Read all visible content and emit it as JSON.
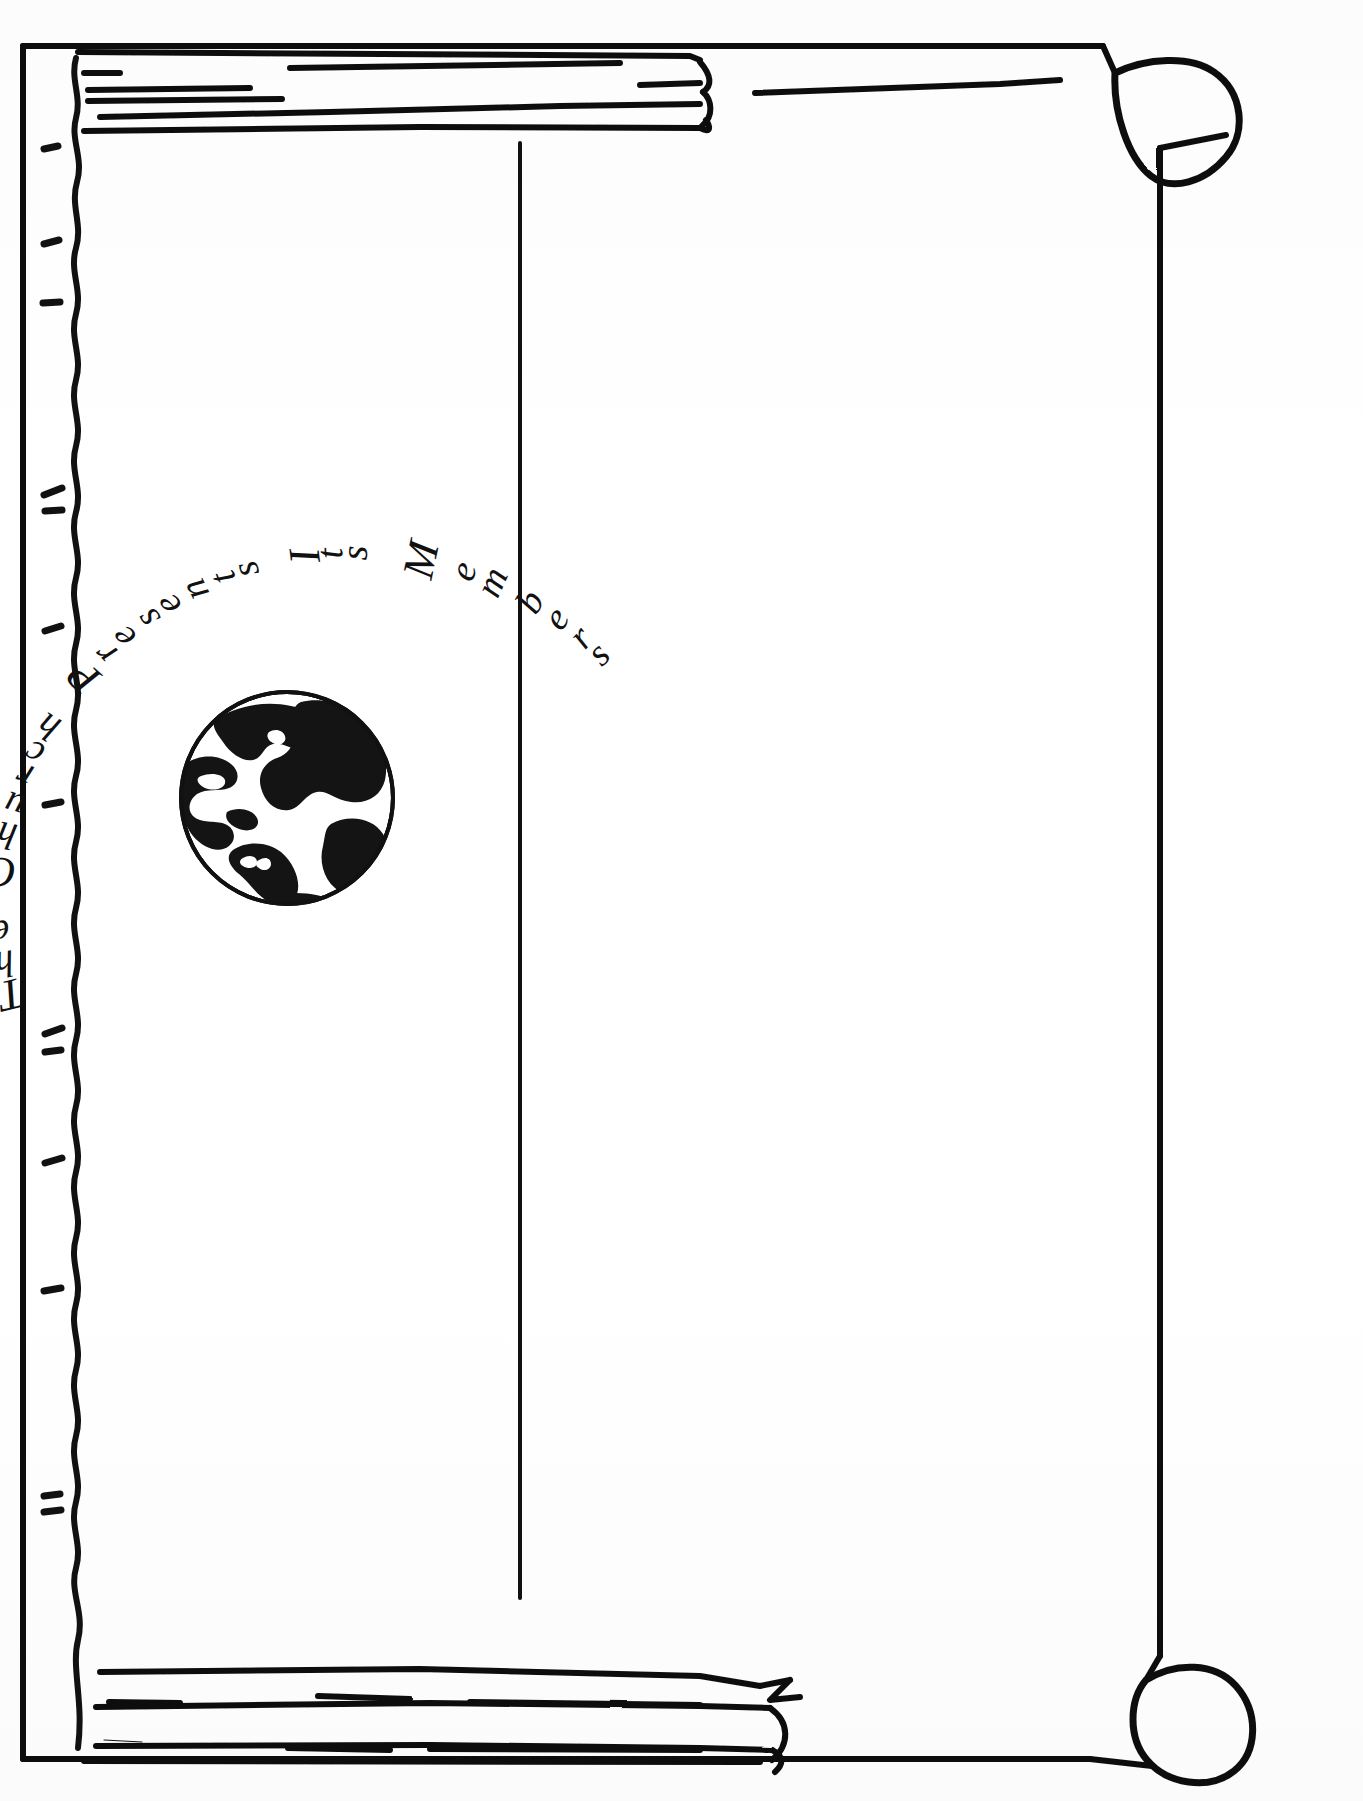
{
  "document": {
    "kind": "scanned-line-art-page",
    "page_background": "#ffffff",
    "ink_color": "#111111",
    "width_px": 1363,
    "height_px": 1801
  },
  "heading": {
    "full_text": "The Church Presents Its Members",
    "style": "arched italic serif, rotated counter-clockwise along a curve",
    "words": [
      {
        "text": "The"
      },
      {
        "text": "Church"
      },
      {
        "text": "Presents"
      },
      {
        "text": "Its"
      },
      {
        "text": "Members"
      }
    ],
    "letters": [
      {
        "ch": "T",
        "angle": -104,
        "radius": 352
      },
      {
        "ch": "h",
        "angle": -99,
        "radius": 352
      },
      {
        "ch": "e",
        "angle": -94,
        "radius": 352
      },
      {
        "ch": " ",
        "angle": -89,
        "radius": 352
      },
      {
        "ch": "C",
        "angle": -84,
        "radius": 352
      },
      {
        "ch": "h",
        "angle": -78,
        "radius": 352
      },
      {
        "ch": "u",
        "angle": -73,
        "radius": 352
      },
      {
        "ch": "r",
        "angle": -68,
        "radius": 352
      },
      {
        "ch": "c",
        "angle": -64,
        "radius": 352
      },
      {
        "ch": "h",
        "angle": -59,
        "radius": 352
      },
      {
        "ch": " ",
        "angle": -54,
        "radius": 352
      },
      {
        "ch": "P",
        "angle": -49,
        "radius": 352
      },
      {
        "ch": "r",
        "angle": -44,
        "radius": 352
      },
      {
        "ch": "e",
        "angle": -40,
        "radius": 352
      },
      {
        "ch": "s",
        "angle": -35,
        "radius": 352
      },
      {
        "ch": "e",
        "angle": -31,
        "radius": 352
      },
      {
        "ch": "n",
        "angle": -26,
        "radius": 352
      },
      {
        "ch": "t",
        "angle": -21,
        "radius": 352
      },
      {
        "ch": "s",
        "angle": -17,
        "radius": 352
      },
      {
        "ch": " ",
        "angle": -12,
        "radius": 352
      },
      {
        "ch": "I",
        "angle": -7,
        "radius": 352
      },
      {
        "ch": "t",
        "angle": -3,
        "radius": 352
      },
      {
        "ch": "s",
        "angle": 1,
        "radius": 352
      },
      {
        "ch": " ",
        "angle": 6,
        "radius": 352
      },
      {
        "ch": "M",
        "angle": 12,
        "radius": 352
      },
      {
        "ch": "e",
        "angle": 19,
        "radius": 352
      },
      {
        "ch": "m",
        "angle": 24,
        "radius": 352
      },
      {
        "ch": "b",
        "angle": 31,
        "radius": 352
      },
      {
        "ch": "e",
        "angle": 36,
        "radius": 352
      },
      {
        "ch": "r",
        "angle": 41,
        "radius": 352
      },
      {
        "ch": "s",
        "angle": 45,
        "radius": 352
      }
    ]
  },
  "illustration": {
    "globe": {
      "label": "globe-illustration",
      "description": "Filled black globe showing North and South America landmasses, thin circular outline",
      "center_x": 287,
      "center_y": 798,
      "radius": 107
    }
  },
  "frame": {
    "outer_border": {
      "label": "outer-page-border",
      "x": 20,
      "y": 40,
      "width": 1322,
      "height": 1721
    },
    "binding_edge": {
      "label": "wavy-binding-edge",
      "x": 75,
      "description": "hand-drawn wavy vertical line near left margin"
    },
    "tick_marks": {
      "label": "binding-tick-marks",
      "count": 10,
      "y_positions": [
        148,
        243,
        303,
        492,
        510,
        630,
        805,
        1035,
        1052,
        1162,
        1290,
        1497,
        1512
      ]
    },
    "center_divider": {
      "label": "vertical-center-rule",
      "x": 520,
      "y_top": 143,
      "y_bottom": 1596
    },
    "rolled_corners": [
      {
        "label": "rolled-corner-top-right",
        "x": 1103,
        "y": 102
      },
      {
        "label": "rolled-corner-bottom-right",
        "x": 1103,
        "y": 1700
      }
    ],
    "scroll_bands": [
      {
        "label": "top-scroll-band",
        "y_top": 48,
        "y_bottom": 140,
        "curl_side": "right"
      },
      {
        "label": "bottom-scroll-band",
        "y_top": 1470,
        "y_bottom": 1762,
        "curl_side": "right"
      }
    ]
  },
  "content_area": {
    "label": "blank-photo-area",
    "note": "Large empty white area intended for member photographs"
  }
}
